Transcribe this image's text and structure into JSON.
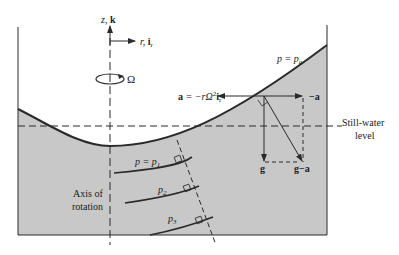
{
  "colors": {
    "fluid": "#c8c8c8",
    "line": "#2a2a2a",
    "background": "#ffffff"
  },
  "labels": {
    "z_axis": "z, ",
    "z_axis_bold": "k",
    "r_axis": "r, ",
    "r_axis_bold": "i",
    "r_axis_sub": "r",
    "omega": "Ω",
    "surface_pressure": "p = p",
    "surface_pressure_sub": "a",
    "accel_bold": "a",
    "accel_rest": " = −rΩ",
    "accel_sup": "2",
    "accel_ir": "i",
    "accel_ir_sub": "r",
    "neg_a": "−a",
    "g": "g",
    "g_minus_a": "g−a",
    "still_water_line1": "Still-water",
    "still_water_line2": "level",
    "p1": "p = p",
    "p1_sub": "1",
    "p2": "p",
    "p2_sub": "2",
    "p3": "p",
    "p3_sub": "3",
    "axis_line1": "Axis of",
    "axis_line2": "rotation"
  }
}
